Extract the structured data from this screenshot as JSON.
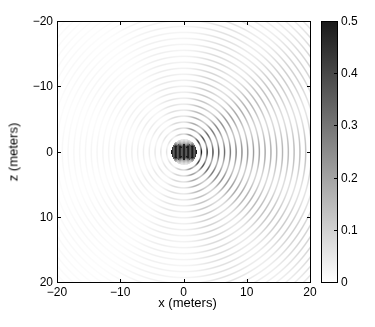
{
  "chart_data": {
    "type": "heatmap",
    "title": "",
    "xlabel": "x (meters)",
    "ylabel": "z (meters)",
    "xlim": [
      -20,
      20
    ],
    "ylim": [
      -20,
      20
    ],
    "y_axis_direction": "down",
    "x_ticks": [
      -20,
      -10,
      0,
      10,
      20
    ],
    "x_tick_labels": [
      "−20",
      "−10",
      "0",
      "10",
      "20"
    ],
    "y_ticks": [
      -20,
      -10,
      0,
      10,
      20
    ],
    "y_tick_labels": [
      "−20",
      "−10",
      "0",
      "10",
      "20"
    ],
    "colorbar": {
      "range": [
        0,
        0.5
      ],
      "ticks": [
        0,
        0.1,
        0.2,
        0.3,
        0.4,
        0.5
      ],
      "tick_labels": [
        "0",
        "0.1",
        "0.2",
        "0.3",
        "0.4",
        "0.5"
      ],
      "colormap": "gray_reversed",
      "low_color": "#ffffff",
      "high_color": "#1a1a1a"
    },
    "field": {
      "description": "Concentric wave rings radiating from a source near origin, strongest toward +x",
      "source_center": [
        0,
        0
      ],
      "source_extent_x": [
        -1.5,
        1.5
      ],
      "wavelength_m": 0.92,
      "peak_value_at_source": 0.5,
      "value_at_right_edge_rings": 0.28,
      "value_at_left_edge_rings": 0.04,
      "directivity_axis": "+x"
    },
    "grid": false
  }
}
